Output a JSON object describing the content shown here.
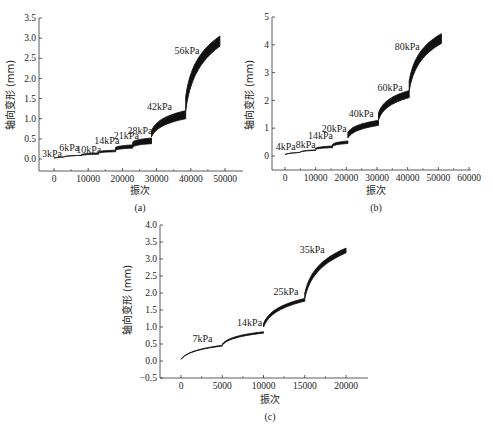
{
  "chart_data": [
    {
      "id": "a",
      "type": "area",
      "caption": "(a)",
      "xlabel": "振次",
      "ylabel": "轴向变形 (mm)",
      "xlim": [
        -4000,
        55000
      ],
      "ylim": [
        -0.25,
        3.5
      ],
      "xticks": [
        0,
        10000,
        20000,
        30000,
        40000,
        50000
      ],
      "yticks": [
        0.0,
        0.5,
        1.0,
        1.5,
        2.0,
        2.5,
        3.0,
        3.5
      ],
      "ytick_format": 1,
      "grid": false,
      "series": [
        {
          "name": "3kPa",
          "x_range": [
            0,
            3000
          ],
          "start": [
            0.02,
            0.02
          ],
          "end": [
            0.05,
            0.05
          ]
        },
        {
          "name": "6kPa",
          "x_range": [
            3000,
            8000
          ],
          "start": [
            0.06,
            0.06
          ],
          "end": [
            0.09,
            0.09
          ]
        },
        {
          "name": "10kPa",
          "x_range": [
            8000,
            13000
          ],
          "start": [
            0.11,
            0.09
          ],
          "end": [
            0.15,
            0.12
          ]
        },
        {
          "name": "14kPa",
          "x_range": [
            13000,
            18000
          ],
          "start": [
            0.18,
            0.15
          ],
          "end": [
            0.22,
            0.18
          ]
        },
        {
          "name": "21kPa",
          "x_range": [
            18000,
            23000
          ],
          "start": [
            0.29,
            0.22
          ],
          "end": [
            0.35,
            0.27
          ]
        },
        {
          "name": "28kPa",
          "x_range": [
            23000,
            28500
          ],
          "start": [
            0.42,
            0.3
          ],
          "end": [
            0.52,
            0.38
          ]
        },
        {
          "name": "42kPa",
          "x_range": [
            28500,
            38500
          ],
          "start": [
            0.7,
            0.55
          ],
          "end": [
            1.2,
            1.0
          ]
        },
        {
          "name": "56kPa",
          "x_range": [
            38500,
            48500
          ],
          "start": [
            1.55,
            1.2
          ],
          "end": [
            3.05,
            2.8
          ]
        }
      ],
      "annotations": [
        {
          "text": "3kPa",
          "x": -3500,
          "y": 0.05
        },
        {
          "text": "6kPa",
          "x": 1500,
          "y": 0.19
        },
        {
          "text": "10kPa",
          "x": 6500,
          "y": 0.16
        },
        {
          "text": "14kPa",
          "x": 11800,
          "y": 0.37
        },
        {
          "text": "21kPa",
          "x": 17500,
          "y": 0.5
        },
        {
          "text": "28kPa",
          "x": 21500,
          "y": 0.63
        },
        {
          "text": "42kPa",
          "x": 27200,
          "y": 1.22
        },
        {
          "text": "56kPa",
          "x": 35200,
          "y": 2.6
        }
      ]
    },
    {
      "id": "b",
      "type": "area",
      "caption": "(b)",
      "xlabel": "振次",
      "ylabel": "轴向变形 (mm)",
      "xlim": [
        -4000,
        61000
      ],
      "ylim": [
        -0.5,
        5
      ],
      "xticks": [
        0,
        10000,
        20000,
        30000,
        40000,
        50000,
        60000
      ],
      "yticks": [
        0,
        1,
        2,
        3,
        4,
        5
      ],
      "ytick_format": 0,
      "grid": false,
      "series": [
        {
          "name": "4kPa",
          "x_range": [
            0,
            5000
          ],
          "start": [
            0.05,
            0.05
          ],
          "end": [
            0.13,
            0.13
          ]
        },
        {
          "name": "8kPa",
          "x_range": [
            5000,
            10000
          ],
          "start": [
            0.15,
            0.15
          ],
          "end": [
            0.22,
            0.2
          ]
        },
        {
          "name": "14kPa",
          "x_range": [
            10000,
            15500
          ],
          "start": [
            0.28,
            0.24
          ],
          "end": [
            0.36,
            0.3
          ]
        },
        {
          "name": "20kPa",
          "x_range": [
            15500,
            20500
          ],
          "start": [
            0.42,
            0.35
          ],
          "end": [
            0.54,
            0.45
          ]
        },
        {
          "name": "40kPa",
          "x_range": [
            20500,
            30500
          ],
          "start": [
            0.85,
            0.65
          ],
          "end": [
            1.28,
            1.1
          ]
        },
        {
          "name": "60kPa",
          "x_range": [
            30500,
            40500
          ],
          "start": [
            1.55,
            1.3
          ],
          "end": [
            2.35,
            2.1
          ]
        },
        {
          "name": "80kPa",
          "x_range": [
            40500,
            51000
          ],
          "start": [
            2.7,
            2.35
          ],
          "end": [
            4.4,
            4.05
          ]
        }
      ],
      "annotations": [
        {
          "text": "4kPa",
          "x": -3000,
          "y": 0.2
        },
        {
          "text": "8kPa",
          "x": 3500,
          "y": 0.3
        },
        {
          "text": "14kPa",
          "x": 7500,
          "y": 0.6
        },
        {
          "text": "20kPa",
          "x": 12000,
          "y": 0.88
        },
        {
          "text": "40kPa",
          "x": 20800,
          "y": 1.4
        },
        {
          "text": "60kPa",
          "x": 30200,
          "y": 2.35
        },
        {
          "text": "80kPa",
          "x": 35800,
          "y": 3.8
        }
      ]
    },
    {
      "id": "c",
      "type": "area",
      "caption": "(c)",
      "xlabel": "振次",
      "ylabel": "轴向变形 (mm)",
      "xlim": [
        -2000,
        22500
      ],
      "ylim": [
        -0.5,
        4.0
      ],
      "xticks": [
        0,
        5000,
        10000,
        15000,
        20000
      ],
      "yticks": [
        -0.5,
        0.0,
        0.5,
        1.0,
        1.5,
        2.0,
        2.5,
        3.0,
        3.5,
        4.0
      ],
      "ytick_format": 1,
      "grid": false,
      "series": [
        {
          "name": "7kPa",
          "x_range": [
            0,
            5000
          ],
          "start": [
            0.05,
            0.05
          ],
          "end": [
            0.46,
            0.44
          ]
        },
        {
          "name": "14kPa",
          "x_range": [
            5000,
            10000
          ],
          "start": [
            0.5,
            0.47
          ],
          "end": [
            0.86,
            0.82
          ]
        },
        {
          "name": "25kPa",
          "x_range": [
            10000,
            15000
          ],
          "start": [
            1.1,
            1.0
          ],
          "end": [
            1.84,
            1.76
          ]
        },
        {
          "name": "35kPa",
          "x_range": [
            15000,
            20000
          ],
          "start": [
            2.0,
            1.85
          ],
          "end": [
            3.32,
            3.18
          ]
        }
      ],
      "annotations": [
        {
          "text": "7kPa",
          "x": 1400,
          "y": 0.56
        },
        {
          "text": "14kPa",
          "x": 6800,
          "y": 1.02
        },
        {
          "text": "25kPa",
          "x": 11200,
          "y": 1.93
        },
        {
          "text": "35kPa",
          "x": 14400,
          "y": 3.18
        }
      ]
    }
  ],
  "panels": {
    "a": {
      "caption": "(a)",
      "xlabel": "振次",
      "ylabel": "轴向变形 (mm)"
    },
    "b": {
      "caption": "(b)",
      "xlabel": "振次",
      "ylabel": "轴向变形 (mm)"
    },
    "c": {
      "caption": "(c)",
      "xlabel": "振次",
      "ylabel": "轴向变形 (mm)"
    }
  },
  "colors": {
    "curve": "#111111",
    "axis": "#333333",
    "text": "#222222"
  }
}
